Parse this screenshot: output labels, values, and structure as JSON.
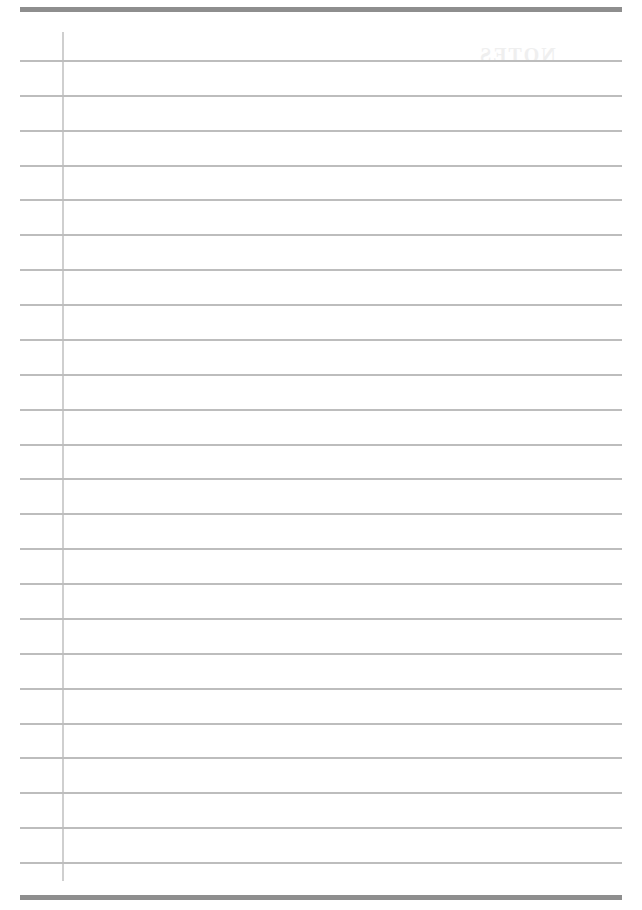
{
  "page": {
    "type": "lined-notebook-page",
    "ruled_line_count": 24,
    "first_rule_y": 60,
    "rule_spacing_px": 34.87,
    "margin_line_x": 62,
    "show_through_heading": "NOTES",
    "colors": {
      "background": "#ffffff",
      "border_bar": "#8e8e8e",
      "ruled_line": "#bdbdbd",
      "margin_line": "#cfcfcf",
      "show_through_text": "#efefef"
    }
  }
}
